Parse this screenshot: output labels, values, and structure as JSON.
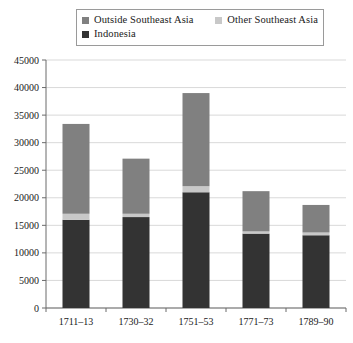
{
  "legend": {
    "entries": [
      {
        "label": "Outside Southeast Asia",
        "color": "#808080",
        "swatch_icon": "square-swatch-icon"
      },
      {
        "label": "Other Southeast Asia",
        "color": "#c8c8c8",
        "swatch_icon": "square-swatch-icon"
      },
      {
        "label": "Indonesia",
        "color": "#333333",
        "swatch_icon": "square-swatch-icon"
      }
    ]
  },
  "chart_data": {
    "type": "bar",
    "subtype": "stacked",
    "title": "",
    "xlabel": "",
    "ylabel": "",
    "categories": [
      "1711–13",
      "1730–32",
      "1751–53",
      "1771–73",
      "1789–90"
    ],
    "series": [
      {
        "name": "Indonesia",
        "color": "#333333",
        "values": [
          16000,
          16500,
          21000,
          13500,
          13200
        ]
      },
      {
        "name": "Other Southeast Asia",
        "color": "#c8c8c8",
        "values": [
          1100,
          600,
          1100,
          400,
          500
        ]
      },
      {
        "name": "Outside Southeast Asia",
        "color": "#808080",
        "values": [
          16300,
          10000,
          16900,
          7300,
          5000
        ]
      }
    ],
    "totals": [
      33400,
      27100,
      39000,
      21200,
      18700
    ],
    "ylim": [
      0,
      45000
    ],
    "ytick_step": 5000,
    "yticks": [
      "0",
      "5000",
      "10000",
      "15000",
      "20000",
      "25000",
      "30000",
      "35000",
      "40000",
      "45000"
    ],
    "grid": true,
    "legend_position": "top"
  }
}
